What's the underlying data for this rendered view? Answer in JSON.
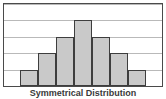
{
  "figure": {
    "caption": "Symmetrical Distribution",
    "frame_color": "#4a4a4a",
    "grid_color": "#b9b9b9",
    "background": "#ffffff"
  },
  "chart_data": {
    "type": "bar",
    "title": "Symmetrical Distribution",
    "xlabel": "",
    "ylabel": "",
    "categories": [
      "1",
      "2",
      "3",
      "4",
      "5",
      "6",
      "7"
    ],
    "values": [
      1,
      2,
      3,
      4,
      3,
      2,
      1
    ],
    "ylim": [
      0,
      5
    ],
    "grid": true,
    "gridlines": [
      1,
      2,
      3,
      4,
      5
    ],
    "legend": "none",
    "bar_fill": "#c9c9c9",
    "bar_edge": "#3d3d3d",
    "tick_labels_x": [],
    "tick_labels_y": [],
    "shape": "bell-shaped symmetric"
  }
}
